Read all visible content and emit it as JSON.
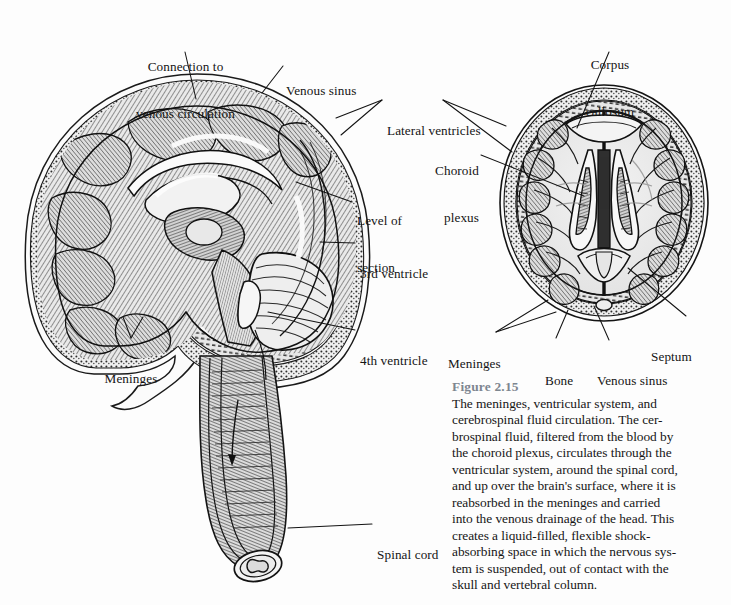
{
  "figure": {
    "number_label": "Figure 2.15",
    "number_color": "#7d8690",
    "caption_lines": [
      "The meninges, ventricular system, and",
      "cerebrospinal fluid circulation. The cer-",
      "brospinal fluid, filtered from the blood by",
      "the choroid plexus, circulates through the",
      "ventricular system, around the spinal cord,",
      "and up over the brain's surface, where it is",
      "reabsorbed in the meninges and carried",
      "into the venous drainage of the head. This",
      "creates a liquid-filled, flexible shock-",
      "absorbing space in which the nervous sys-",
      "tem is suspended, out of contact with the",
      "skull and vertebral column."
    ],
    "caption_full": "The meninges, ventricular system, and cerebrospinal fluid circulation. The cerebrospinal fluid, filtered from the blood by the choroid plexus, circulates through the ventricular system, around the spinal cord, and up over the brain's surface, where it is reabsorbed in the meninges and carried into the venous drainage of the head. This creates a liquid-filled, flexible shock-absorbing space in which the nervous system is suspended, out of contact with the skull and vertebral column."
  },
  "illustration": {
    "style": "pen-and-ink engraving, grayscale",
    "background_color": "#fdfdfd",
    "ink_color": "#1a1a1a",
    "panels": [
      {
        "id": "midsagittal",
        "name": "midsagittal-brain-and-spinal-cord",
        "description": "Midsagittal section of the head showing brain, meninges, ventricles and spinal cord"
      },
      {
        "id": "horizontal",
        "name": "horizontal-brain-section",
        "description": "Horizontal (axial) section of the brain showing lateral ventricles, corpus callosum and septum"
      }
    ]
  },
  "labels": {
    "midsagittal": [
      {
        "id": "connection-venous-circulation",
        "lines": [
          "Connection to",
          "venous circulation"
        ]
      },
      {
        "id": "venous-sinus-left",
        "lines": [
          "Venous sinus"
        ]
      },
      {
        "id": "lateral-ventricles",
        "lines": [
          "Lateral ventricles"
        ]
      },
      {
        "id": "level-of-section",
        "lines": [
          "Level of",
          "section"
        ]
      },
      {
        "id": "third-ventricle",
        "lines": [
          "3rd ventricle"
        ]
      },
      {
        "id": "fourth-ventricle",
        "lines": [
          "4th ventricle"
        ]
      },
      {
        "id": "meninges-left",
        "lines": [
          "Meninges"
        ]
      },
      {
        "id": "spinal-cord",
        "lines": [
          "Spinal cord"
        ]
      }
    ],
    "horizontal": [
      {
        "id": "corpus-callosum",
        "lines": [
          "Corpus",
          "callosum"
        ]
      },
      {
        "id": "choroid-plexus",
        "lines": [
          "Choroid",
          "plexus"
        ]
      },
      {
        "id": "septum",
        "lines": [
          "Septum"
        ]
      },
      {
        "id": "venous-sinus-right",
        "lines": [
          "Venous sinus"
        ]
      },
      {
        "id": "bone",
        "lines": [
          "Bone"
        ]
      },
      {
        "id": "meninges-right",
        "lines": [
          "Meninges"
        ]
      }
    ]
  }
}
